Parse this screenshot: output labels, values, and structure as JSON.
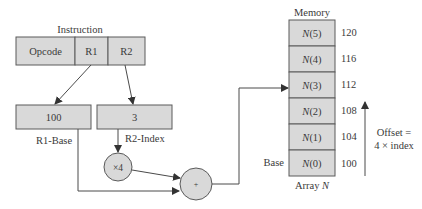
{
  "instruction": {
    "title": "Instruction",
    "fields": [
      {
        "label": "Opcode"
      },
      {
        "label": "R1"
      },
      {
        "label": "R2"
      }
    ]
  },
  "registers": {
    "r1": {
      "value": "100",
      "label": "R1-Base"
    },
    "r2": {
      "value": "3",
      "label": "R2-Index"
    }
  },
  "operators": {
    "multiply": "×4",
    "add": "+"
  },
  "memory": {
    "title": "Memory",
    "array_label_prefix": "Array ",
    "array_label_name": "N",
    "base_label": "Base",
    "cells": [
      {
        "name": "N",
        "index": "(5)",
        "address": "120"
      },
      {
        "name": "N",
        "index": "(4)",
        "address": "116"
      },
      {
        "name": "N",
        "index": "(3)",
        "address": "112"
      },
      {
        "name": "N",
        "index": "(2)",
        "address": "108"
      },
      {
        "name": "N",
        "index": "(1)",
        "address": "104"
      },
      {
        "name": "N",
        "index": "(0)",
        "address": "100"
      }
    ]
  },
  "offset": {
    "line1": "Offset =",
    "line2": "4 × index"
  },
  "colors": {
    "box_fill": "#d9d9d9",
    "stroke": "#4a4a4a",
    "text": "#3a3a3a"
  }
}
